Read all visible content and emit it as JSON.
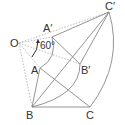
{
  "diagram": {
    "type": "geometry-rotation",
    "labels": {
      "O": "O",
      "A": "A",
      "B": "B",
      "C": "C",
      "A_prime": "A′",
      "B_prime": "B′",
      "C_prime": "C′",
      "angle": "60°"
    },
    "rotation_angle_deg": 60,
    "colors": {
      "line": "#888888",
      "dotted": "#aaaaaa",
      "text": "#333333"
    }
  }
}
